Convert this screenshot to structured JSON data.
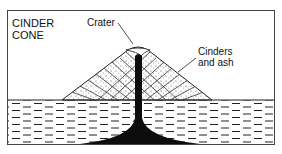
{
  "diagram": {
    "title_lines": [
      "CINDER",
      "CONE"
    ],
    "labels": {
      "crater": "Crater",
      "cinders_lines": [
        "Cinders",
        "and ash"
      ]
    },
    "colors": {
      "ink": "#111111",
      "background": "#ffffff",
      "magma": "#0d0d0d",
      "frame": "#444444"
    }
  }
}
